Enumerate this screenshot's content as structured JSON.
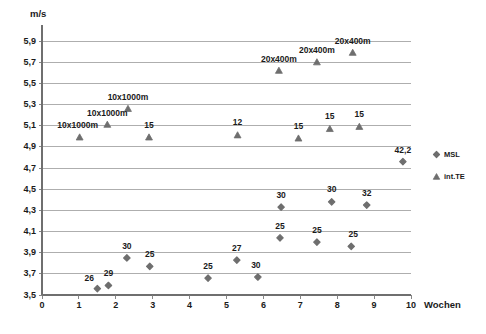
{
  "chart_data": {
    "type": "scatter",
    "title": "",
    "xlabel": "Wochen",
    "ylabel": "m/s",
    "xlim": [
      0,
      10
    ],
    "ylim": [
      3.5,
      5.9
    ],
    "ytick_step": 0.2,
    "grid": "horizontal",
    "legend_position": "right",
    "xticks": [
      "0",
      "1",
      "2",
      "3",
      "4",
      "5",
      "6",
      "7",
      "8",
      "9",
      "10"
    ],
    "yticks": [
      "3,5",
      "3,7",
      "3,9",
      "4,1",
      "4,3",
      "4,5",
      "4,7",
      "4,9",
      "5,1",
      "5,3",
      "5,5",
      "5,7",
      "5,9"
    ],
    "series": [
      {
        "name": "MSL",
        "marker": "diamond",
        "color": "#6e6e6e",
        "points": [
          {
            "x": 1.5,
            "y": 3.56,
            "label": "26",
            "label_dx": -8,
            "label_dy": -10
          },
          {
            "x": 1.8,
            "y": 3.59,
            "label": "29",
            "label_dx": 0,
            "label_dy": -11
          },
          {
            "x": 2.3,
            "y": 3.85,
            "label": "30",
            "label_dx": 0,
            "label_dy": -11
          },
          {
            "x": 2.92,
            "y": 3.77,
            "label": "25",
            "label_dx": 0,
            "label_dy": -11
          },
          {
            "x": 4.5,
            "y": 3.66,
            "label": "25",
            "label_dx": 0,
            "label_dy": -11
          },
          {
            "x": 5.28,
            "y": 3.83,
            "label": "27",
            "label_dx": 0,
            "label_dy": -11
          },
          {
            "x": 5.85,
            "y": 3.67,
            "label": "30",
            "label_dx": -2,
            "label_dy": -11
          },
          {
            "x": 6.45,
            "y": 4.04,
            "label": "25",
            "label_dx": 0,
            "label_dy": -11
          },
          {
            "x": 6.48,
            "y": 4.33,
            "label": "30",
            "label_dx": 0,
            "label_dy": -11
          },
          {
            "x": 7.45,
            "y": 4.0,
            "label": "25",
            "label_dx": 0,
            "label_dy": -11
          },
          {
            "x": 7.85,
            "y": 4.38,
            "label": "30",
            "label_dx": 0,
            "label_dy": -12
          },
          {
            "x": 8.38,
            "y": 3.96,
            "label": "25",
            "label_dx": 2,
            "label_dy": -11
          },
          {
            "x": 8.8,
            "y": 4.35,
            "label": "32",
            "label_dx": 0,
            "label_dy": -11
          },
          {
            "x": 9.78,
            "y": 4.76,
            "label": "42,2",
            "label_dx": 0,
            "label_dy": -11
          }
        ]
      },
      {
        "name": "int.TE",
        "marker": "triangle",
        "color": "#6e6e6e",
        "points": [
          {
            "x": 1.02,
            "y": 4.99,
            "label": "10x1000m",
            "label_dx": -2,
            "label_dy": -11
          },
          {
            "x": 1.77,
            "y": 5.11,
            "label": "10x1000m",
            "label_dx": 0,
            "label_dy": -11
          },
          {
            "x": 2.33,
            "y": 5.26,
            "label": "10x1000m",
            "label_dx": 0,
            "label_dy": -11
          },
          {
            "x": 2.9,
            "y": 4.99,
            "label": "15",
            "label_dx": 0,
            "label_dy": -11
          },
          {
            "x": 5.3,
            "y": 5.01,
            "label": "12",
            "label_dx": 0,
            "label_dy": -12
          },
          {
            "x": 6.42,
            "y": 5.62,
            "label": "20x400m",
            "label_dx": 0,
            "label_dy": -11
          },
          {
            "x": 6.95,
            "y": 4.98,
            "label": "15",
            "label_dx": 0,
            "label_dy": -11
          },
          {
            "x": 7.45,
            "y": 5.7,
            "label": "20x400m",
            "label_dx": 0,
            "label_dy": -11
          },
          {
            "x": 7.8,
            "y": 5.07,
            "label": "15",
            "label_dx": 0,
            "label_dy": -12
          },
          {
            "x": 8.42,
            "y": 5.79,
            "label": "20x400m",
            "label_dx": 0,
            "label_dy": -11
          },
          {
            "x": 8.6,
            "y": 5.09,
            "label": "15",
            "label_dx": 0,
            "label_dy": -12
          }
        ]
      }
    ]
  },
  "legend": {
    "items": [
      {
        "label": "MSL",
        "marker": "diamond"
      },
      {
        "label": "int.TE",
        "marker": "triangle"
      }
    ]
  }
}
